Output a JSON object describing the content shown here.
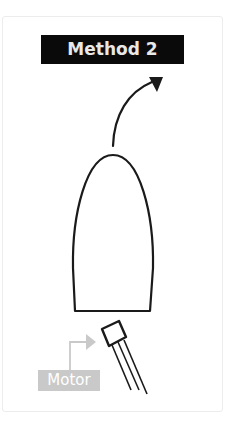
{
  "diagram": {
    "title": "Method 2",
    "motor_label": "Motor",
    "shapes": {
      "movement_arrow": "curved-arrow-up-right",
      "body": "bullet-shaped-outline",
      "component": "transistor-like-motor-part-with-three-leads",
      "connector": "gray-elbow-arrow-pointing-to-component"
    },
    "colors": {
      "title_bg": "#0a0a0a",
      "title_text": "#e8e8e8",
      "outline": "#1a1a1a",
      "motor_label_bg": "#c9c9c9",
      "motor_label_text": "#ffffff",
      "connector": "#c9c9c9",
      "card_border": "#ececec"
    }
  }
}
